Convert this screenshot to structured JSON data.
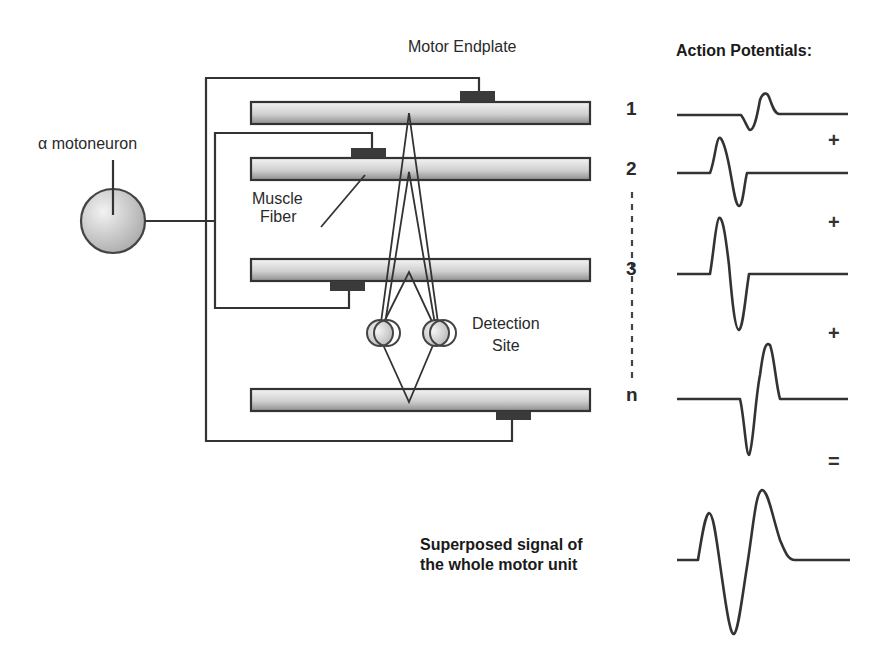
{
  "labels": {
    "motor_endplate": "Motor Endplate",
    "action_potentials_title": "Action Potentials:",
    "alpha_motoneuron": "α  motoneuron",
    "muscle_fiber_line1": "Muscle",
    "muscle_fiber_line2": "Fiber",
    "detection_site_line1": "Detection",
    "detection_site_line2": "Site",
    "superposed_line1": "Superposed signal of",
    "superposed_line2": "the whole motor unit"
  },
  "fiber_numbers": [
    "1",
    "2",
    "3",
    "n"
  ],
  "operators": [
    "+",
    "+",
    "+",
    "="
  ],
  "icons": {
    "motoneuron": "circle-soma-icon",
    "electrode": "electrode-circle-icon",
    "endplate": "endplate-block-icon"
  },
  "colors": {
    "stroke": "#333333",
    "endplate": "#3a3a3a",
    "fiber_top": "#f2f2f2",
    "fiber_bottom": "#9a9a9a"
  }
}
